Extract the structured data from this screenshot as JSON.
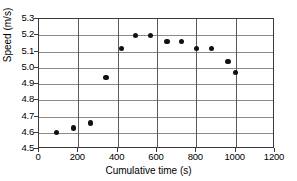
{
  "chart_data": {
    "type": "scatter",
    "title": "",
    "xlabel": "Cumulative time (s)",
    "ylabel": "Speed (m/s)",
    "xlim": [
      0,
      1200
    ],
    "ylim": [
      4.5,
      5.3
    ],
    "xticks": [
      0,
      200,
      400,
      600,
      800,
      1000,
      1200
    ],
    "yticks": [
      4.5,
      4.6,
      4.7,
      4.8,
      4.9,
      5.0,
      5.1,
      5.2,
      5.3
    ],
    "xtick_labels": [
      "0",
      "200",
      "400",
      "600",
      "800",
      "1000",
      "1200"
    ],
    "ytick_labels": [
      "4.5",
      "4.6",
      "4.7",
      "4.8",
      "4.9",
      "5.0",
      "5.1",
      "5.2",
      "5.3"
    ],
    "grid": "horizontal-and-vertical",
    "legend": null,
    "marker": "filled-circle",
    "marker_color": "#111111",
    "x": [
      90,
      175,
      263,
      340,
      418,
      492,
      567,
      650,
      725,
      800,
      878,
      960,
      1000
    ],
    "y": [
      4.6,
      4.63,
      4.66,
      4.94,
      5.12,
      5.2,
      5.2,
      5.16,
      5.16,
      5.12,
      5.12,
      5.04,
      4.97
    ],
    "points": [
      {
        "x": 90,
        "y": 4.6
      },
      {
        "x": 175,
        "y": 4.63
      },
      {
        "x": 263,
        "y": 4.66
      },
      {
        "x": 340,
        "y": 4.94
      },
      {
        "x": 418,
        "y": 5.12
      },
      {
        "x": 492,
        "y": 5.2
      },
      {
        "x": 567,
        "y": 5.2
      },
      {
        "x": 650,
        "y": 5.16
      },
      {
        "x": 725,
        "y": 5.16
      },
      {
        "x": 800,
        "y": 5.12
      },
      {
        "x": 878,
        "y": 5.12
      },
      {
        "x": 960,
        "y": 5.04
      },
      {
        "x": 1000,
        "y": 4.97
      }
    ]
  },
  "colors": {
    "background": "#ffffff",
    "frame": "#3a3a3a",
    "gridline": "#8a8a8a",
    "marker": "#111111",
    "text": "#000000"
  }
}
